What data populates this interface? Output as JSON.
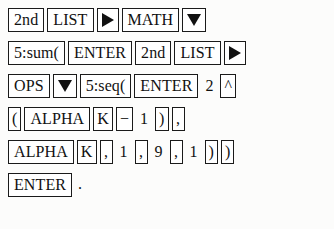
{
  "figure": {
    "kind": "calculator-keystroke-sequence",
    "background_color": "#fcfcfb",
    "key_border_color": "#1a1a1a",
    "text_color": "#111111",
    "trailing_punctuation": "."
  },
  "rows": [
    {
      "index": 1,
      "keys": [
        {
          "label": "2nd",
          "boxed": true,
          "icon": null
        },
        {
          "label": "LIST",
          "boxed": true,
          "icon": null
        },
        {
          "label": "▶",
          "boxed": true,
          "icon": "triangle-right-icon"
        },
        {
          "label": "MATH",
          "boxed": true,
          "icon": null
        },
        {
          "label": "▼",
          "boxed": true,
          "icon": "triangle-down-icon"
        }
      ]
    },
    {
      "index": 2,
      "keys": [
        {
          "label": "5:sum(",
          "boxed": true,
          "icon": null
        },
        {
          "label": "ENTER",
          "boxed": true,
          "icon": null
        },
        {
          "label": "2nd",
          "boxed": true,
          "icon": null
        },
        {
          "label": "LIST",
          "boxed": true,
          "icon": null
        },
        {
          "label": "▶",
          "boxed": true,
          "icon": "triangle-right-icon"
        }
      ]
    },
    {
      "index": 3,
      "keys": [
        {
          "label": "OPS",
          "boxed": true,
          "icon": null
        },
        {
          "label": "▼",
          "boxed": true,
          "icon": "triangle-down-icon"
        },
        {
          "label": "5:seq(",
          "boxed": true,
          "icon": null
        },
        {
          "label": "ENTER",
          "boxed": true,
          "icon": null
        },
        {
          "label": "2",
          "boxed": false,
          "icon": null
        },
        {
          "label": "^",
          "boxed": true,
          "icon": null
        }
      ]
    },
    {
      "index": 4,
      "keys": [
        {
          "label": "(",
          "boxed": true,
          "icon": null
        },
        {
          "label": "ALPHA",
          "boxed": true,
          "icon": null
        },
        {
          "label": "K",
          "boxed": true,
          "icon": null
        },
        {
          "label": "−",
          "boxed": true,
          "icon": null
        },
        {
          "label": "1",
          "boxed": false,
          "icon": null
        },
        {
          "label": ")",
          "boxed": true,
          "icon": null
        },
        {
          "label": ",",
          "boxed": true,
          "icon": null
        }
      ]
    },
    {
      "index": 5,
      "keys": [
        {
          "label": "ALPHA",
          "boxed": true,
          "icon": null
        },
        {
          "label": "K",
          "boxed": true,
          "icon": null
        },
        {
          "label": ",",
          "boxed": true,
          "icon": null
        },
        {
          "label": "1",
          "boxed": false,
          "icon": null
        },
        {
          "label": ",",
          "boxed": true,
          "icon": null
        },
        {
          "label": "9",
          "boxed": false,
          "icon": null
        },
        {
          "label": ",",
          "boxed": true,
          "icon": null
        },
        {
          "label": "1",
          "boxed": false,
          "icon": null
        },
        {
          "label": ")",
          "boxed": true,
          "icon": null
        },
        {
          "label": ")",
          "boxed": true,
          "icon": null
        }
      ]
    },
    {
      "index": 6,
      "keys": [
        {
          "label": "ENTER",
          "boxed": true,
          "icon": null
        }
      ],
      "trailing": "."
    }
  ]
}
